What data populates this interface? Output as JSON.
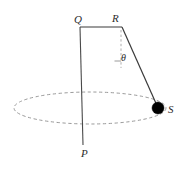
{
  "figure": {
    "background_color": "#ffffff",
    "line_color": "#3a3a3a",
    "dashed_color": "#9a9a9a",
    "bob_color": "#000000",
    "label_color": "#2b2b2b"
  },
  "labels": {
    "Q": "Q",
    "R": "R",
    "S": "S",
    "P": "P",
    "theta": "θ"
  },
  "geometry": {
    "Q": {
      "x": 80,
      "y": 27
    },
    "R": {
      "x": 122,
      "y": 27
    },
    "P": {
      "x": 83,
      "y": 145
    },
    "S": {
      "x": 158,
      "y": 108
    },
    "dashed_vertical_from_R": {
      "x": 121,
      "y_start": 30,
      "y_end": 68
    },
    "angle_tick": {
      "x_start": 115,
      "x_end": 121,
      "y": 61
    },
    "ellipse": {
      "cx": 90,
      "cy": 108,
      "rx": 76,
      "ry": 16
    },
    "bob_radius": 6
  }
}
